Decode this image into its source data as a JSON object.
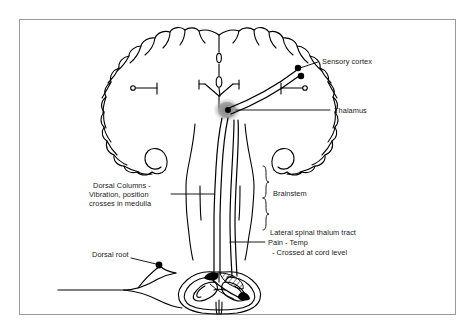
{
  "figure": {
    "background_color": "#ffffff",
    "ink_color": "#000000",
    "frame_color": "#9a9a9a",
    "shade_color": "#9b9b9b"
  },
  "labels": {
    "sensory_cortex": "Sensory cortex",
    "thalamus": "Thalamus",
    "brainstem": "Brainstem",
    "dorsal_root": "Dorsal root",
    "dorsal_columns_line1": "Dorsal Columns -",
    "dorsal_columns_line2": "Vibration, position",
    "dorsal_columns_line3": "crosses in medulla",
    "lateral_tract_line1": "Lateral spinal thalum tract",
    "lateral_tract_line2": "Pain - Temp",
    "lateral_tract_line3": "- Crossed at cord level"
  },
  "structures": {
    "cerebrum": "cerebral-hemispheres-coronal-outline",
    "ventricle": "lateral-and-third-ventricle",
    "thalamus_blob": "thalamus-relay-nucleus",
    "brainstem": "brainstem-medulla",
    "spinal_cord": "spinal-cord-cross-section",
    "gray_matter": "butterfly-gray-matter",
    "dorsal_column_hatch": "dorsal-column-hatched-region",
    "peripheral_nerve": "peripheral-sensory-nerve",
    "dorsal_root_ganglion": "dorsal-root-ganglion-dot",
    "tract_dorsal_column": "dorsal-column-medial-lemniscus-tract",
    "tract_spinothalamic": "lateral-spinothalamic-tract"
  }
}
